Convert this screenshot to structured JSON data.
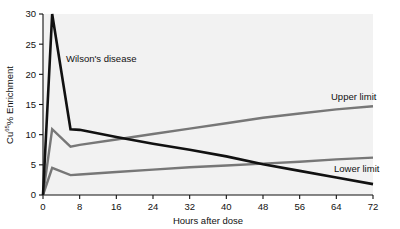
{
  "chart_data": {
    "type": "line",
    "title": "",
    "subtitle": "",
    "xlabel": "Hours after dose",
    "ylabel_parts": {
      "pre": "Cu",
      "superscript": "65",
      "post": "% Enrichment"
    },
    "ylabel": "Cu65% Enrichment",
    "xlim": [
      0,
      72
    ],
    "ylim": [
      0,
      30
    ],
    "xticks": [
      0,
      8,
      16,
      24,
      32,
      40,
      48,
      56,
      64,
      72
    ],
    "yticks": [
      0,
      5,
      10,
      15,
      20,
      25,
      30
    ],
    "xtick_labels": [
      "0",
      "8",
      "16",
      "24",
      "32",
      "40",
      "48",
      "56",
      "64",
      "72"
    ],
    "ytick_labels": [
      "0",
      "5",
      "10",
      "15",
      "20",
      "25",
      "30"
    ],
    "grid": false,
    "legend_position": "inline-annotations",
    "series": [
      {
        "name": "Wilson's disease",
        "color": "#111111",
        "width": 2.6,
        "x": [
          0,
          2,
          6,
          8,
          16,
          24,
          32,
          40,
          48,
          56,
          64,
          72
        ],
        "y": [
          0,
          30,
          10.9,
          10.8,
          9.6,
          8.5,
          7.5,
          6.4,
          5.1,
          4.0,
          2.9,
          1.8
        ]
      },
      {
        "name": "Upper limit",
        "color": "#777777",
        "width": 2.4,
        "x": [
          0,
          2,
          6,
          8,
          16,
          24,
          32,
          40,
          48,
          56,
          64,
          72
        ],
        "y": [
          0,
          10.9,
          8.0,
          8.3,
          9.2,
          10.1,
          11.0,
          11.9,
          12.8,
          13.5,
          14.2,
          14.7
        ]
      },
      {
        "name": "Lower limit",
        "color": "#777777",
        "width": 2.4,
        "x": [
          0,
          2,
          6,
          8,
          16,
          24,
          32,
          40,
          48,
          56,
          64,
          72
        ],
        "y": [
          0,
          4.5,
          3.3,
          3.4,
          3.8,
          4.2,
          4.6,
          4.9,
          5.2,
          5.5,
          5.9,
          6.2
        ]
      }
    ],
    "annotations": [
      {
        "id": "wilsons-disease",
        "text": "Wilson's disease",
        "x_px": 66,
        "y_px": 62
      },
      {
        "id": "upper-limit",
        "text": "Upper limit",
        "x_px": 331,
        "y_px": 100
      },
      {
        "id": "lower-limit",
        "text": "Lower limit",
        "x_px": 334,
        "y_px": 172
      }
    ],
    "colors": {
      "series_black": "#111111",
      "series_gray": "#777777",
      "axis": "#111111",
      "background": "#ffffff",
      "plot_background": "#f2f2f2"
    }
  }
}
